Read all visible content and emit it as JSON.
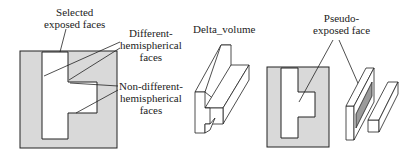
{
  "colors": {
    "ink": "#222222",
    "grey_fill": "#d9d9d9",
    "dark_face": "#9a9a9a",
    "white": "#ffffff"
  },
  "labels": {
    "selected_exposed_faces": "Selected\nexposed faces",
    "different_hemispherical_faces": "Different-\nhemispherical\nfaces",
    "non_different_hemispherical_faces": "Non-different-\nhemispherical\nfaces",
    "delta_volume": "Delta_volume",
    "pseudo_exposed_face": "Pseudo-\nexposed face"
  },
  "panels": [
    {
      "id": "section-view-1",
      "description": "Cross-section with selected exposed faces"
    },
    {
      "id": "delta-volume-3d",
      "description": "Delta volume isometric"
    },
    {
      "id": "section-view-2",
      "description": "Cross-section with pseudo-exposed face"
    },
    {
      "id": "split-volumes-3d",
      "description": "Decomposed volumes isometric"
    }
  ]
}
